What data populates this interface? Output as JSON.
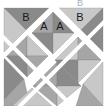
{
  "diagram": {
    "title_partial": "B",
    "colors": {
      "light": "#c8c8c8",
      "mid": "#a6a6a6",
      "dark": "#8a8a8a",
      "sashing": "#ffffff",
      "label": "#1a1a1a"
    },
    "labels": [
      {
        "text": "B",
        "x": 26,
        "y": 17
      },
      {
        "text": "A",
        "x": 44,
        "y": 26
      },
      {
        "text": "A",
        "x": 60,
        "y": 26
      },
      {
        "text": "B",
        "x": 80,
        "y": 17
      }
    ],
    "pieces": [
      {
        "pts": "4,8 49,8 26,30",
        "shade": "dark"
      },
      {
        "pts": "4,8 26,30 4,52",
        "shade": "light"
      },
      {
        "pts": "58,8 103,8 81,30",
        "shade": "light"
      },
      {
        "pts": "103,8 103,52 81,30",
        "shade": "dark"
      },
      {
        "pts": "53,12 32,33 53,33",
        "shade": "mid"
      },
      {
        "pts": "53,12 74,33 53,33",
        "shade": "dark"
      },
      {
        "pts": "32,33 53,54 53,33",
        "shade": "dark"
      },
      {
        "pts": "74,33 53,54 53,33",
        "shade": "light"
      },
      {
        "pts": "27,35 6,56 27,56",
        "shade": "mid"
      },
      {
        "pts": "27,35 48,56 27,56",
        "shade": "light"
      },
      {
        "pts": "6,56 27,77 27,56",
        "shade": "dark"
      },
      {
        "pts": "48,56 27,77 27,56",
        "shade": "mid"
      },
      {
        "pts": "78,37 55,60 78,60",
        "shade": "light"
      },
      {
        "pts": "78,37 101,60 78,60",
        "shade": "mid"
      },
      {
        "pts": "55,60 78,83 78,60",
        "shade": "dark"
      },
      {
        "pts": "101,60 78,83 78,60",
        "shade": "light"
      },
      {
        "pts": "57,62 33,86 57,86",
        "shade": "mid"
      },
      {
        "pts": "57,62 81,86 57,86",
        "shade": "dark"
      },
      {
        "pts": "33,86 57,106 57,86",
        "shade": "mid"
      },
      {
        "pts": "81,86 57,106 57,86",
        "shade": "light"
      },
      {
        "pts": "4,58 24,79 4,100",
        "shade": "dark"
      },
      {
        "pts": "4,100 24,79 30,106 4,106",
        "shade": "mid"
      },
      {
        "pts": "12,106 32,88 52,106",
        "shade": "light"
      },
      {
        "pts": "103,62 83,84 103,106",
        "shade": "light"
      },
      {
        "pts": "83,84 103,106 76,106",
        "shade": "mid"
      }
    ],
    "sashing": [
      {
        "x1": 0,
        "y1": 60,
        "x2": 56,
        "y2": 4
      },
      {
        "x1": 20,
        "y1": 106,
        "x2": 107,
        "y2": 19
      },
      {
        "x1": 52,
        "y1": 4,
        "x2": 107,
        "y2": 59
      },
      {
        "x1": 0,
        "y1": 34,
        "x2": 72,
        "y2": 106
      },
      {
        "x1": 0,
        "y1": 8,
        "x2": 0,
        "y2": 106
      },
      {
        "x1": 107,
        "y1": 8,
        "x2": 107,
        "y2": 106
      }
    ]
  }
}
